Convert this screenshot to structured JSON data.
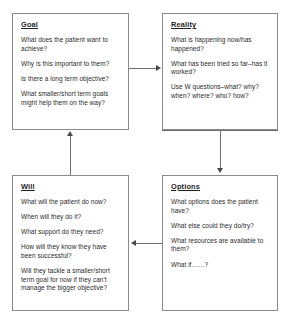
{
  "diagram": {
    "boxes": [
      {
        "id": "goal",
        "title": "Goal",
        "lines": [
          "What does the patient want to achieve?",
          "Why is this important to them?",
          "Is there a long term objective?",
          "What smaller/short term goals might help them on the way?"
        ]
      },
      {
        "id": "reality",
        "title": "Reality",
        "lines": [
          "What is happening now/has happened?",
          "What has been tried so far–has it worked?",
          "Use W questions–what? why? when? where? who? how?"
        ]
      },
      {
        "id": "will",
        "title": "Will",
        "lines": [
          "What will the patient do now?",
          "When will they do it?",
          "What support do they need?",
          "How will they know they have been successful?",
          "Will they tackle a smaller/short term goal for now if they can't manage the bigger objective?"
        ]
      },
      {
        "id": "options",
        "title": "Options",
        "lines": [
          "What options does the patient have?",
          "What else could they do/try?",
          "What resources are available to them?",
          "What if……?"
        ]
      }
    ],
    "connectors": [
      {
        "id": "goal-to-reality",
        "direction": "right"
      },
      {
        "id": "reality-to-options",
        "direction": "down"
      },
      {
        "id": "options-to-will",
        "direction": "left"
      },
      {
        "id": "will-to-goal",
        "direction": "up"
      }
    ],
    "colors": {
      "box_border": "#8a8a8a",
      "connector": "#6f6f6f",
      "arrowhead": "#4a4a4a",
      "title_text": "#1f1f1f",
      "body_text": "#2b2b2b",
      "background": "#ffffff"
    }
  }
}
